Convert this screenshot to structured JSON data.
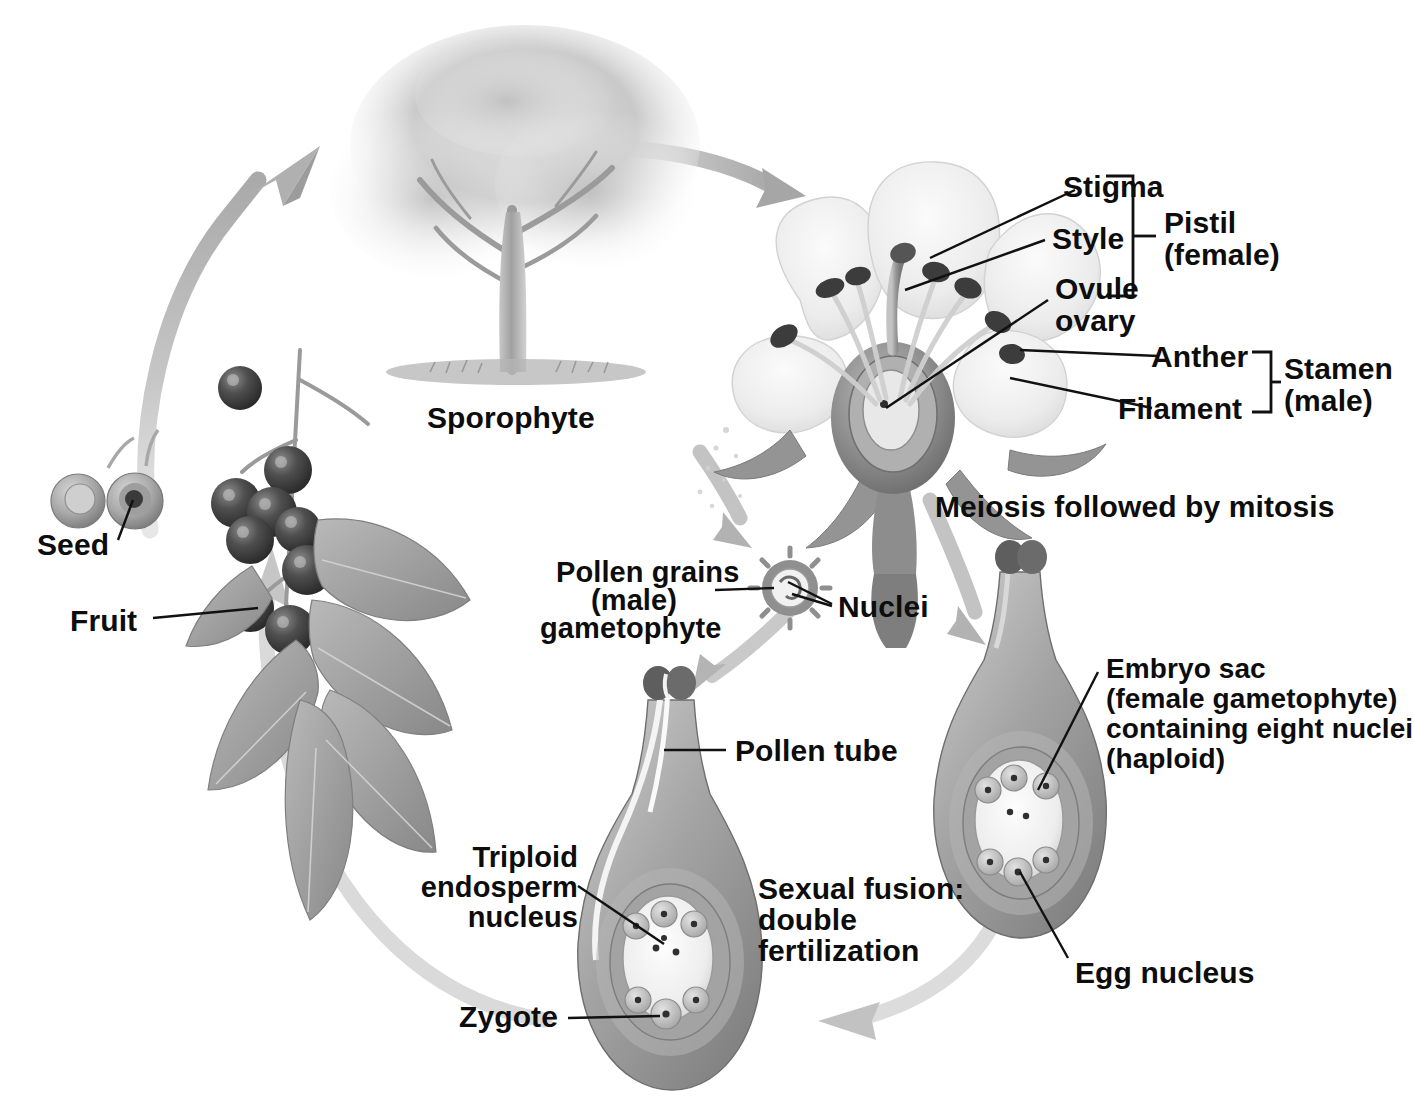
{
  "diagram": {
    "type": "biology-life-cycle-diagram",
    "palette": {
      "ink": "#0d0d0d",
      "arrow_gray": "#b6b6b6",
      "arrow_gray_dark": "#9a9a9a",
      "tissue_mid": "#9c9c9c",
      "tissue_dark": "#6f6f6f",
      "tissue_light": "#d8d8d8",
      "petal": "#ededed",
      "background": "#ffffff"
    }
  },
  "labels": {
    "sporophyte": "Sporophyte",
    "seed": "Seed",
    "fruit": "Fruit",
    "stigma": "Stigma",
    "style": "Style",
    "ovule": "Ovule",
    "ovary": "ovary",
    "pistil_line1": "Pistil",
    "pistil_line2": "(female)",
    "anther": "Anther",
    "filament": "Filament",
    "stamen_line1": "Stamen",
    "stamen_line2": "(male)",
    "meiosis": "Meiosis followed by mitosis",
    "pollen_line1": "Pollen grains",
    "pollen_line2": "(male)",
    "pollen_line3": "gametophyte",
    "nuclei": "Nuclei",
    "pollen_tube": "Pollen tube",
    "embryo_sac_line1": "Embryo sac",
    "embryo_sac_line2": "(female gametophyte)",
    "embryo_sac_line3": "containing eight nuclei",
    "embryo_sac_line4": "(haploid)",
    "egg_nucleus": "Egg nucleus",
    "triploid_line1": "Triploid",
    "triploid_line2": "endosperm",
    "triploid_line3": "nucleus",
    "zygote": "Zygote",
    "fusion_line1": "Sexual fusion:",
    "fusion_line2": "double",
    "fusion_line3": "fertilization"
  },
  "brackets": [
    {
      "name": "pistil-bracket",
      "group": "Pistil (female)",
      "members": [
        "Stigma",
        "Style",
        "Ovule ovary"
      ]
    },
    {
      "name": "stamen-bracket",
      "group": "Stamen (male)",
      "members": [
        "Anther",
        "Filament"
      ]
    }
  ],
  "stages": [
    {
      "name": "sporophyte-tree",
      "label": "Sporophyte"
    },
    {
      "name": "flower",
      "label": "Meiosis followed by mitosis"
    },
    {
      "name": "pollen-grain",
      "label": "Pollen grains (male) gametophyte"
    },
    {
      "name": "ovule-embryo-sac",
      "label": "Embryo sac (female gametophyte) containing eight nuclei (haploid)"
    },
    {
      "name": "fertilized-ovule",
      "label": "Sexual fusion: double fertilization"
    },
    {
      "name": "fruit-berries",
      "label": "Fruit"
    },
    {
      "name": "seeds",
      "label": "Seed"
    }
  ],
  "cycle_arrows": [
    {
      "name": "arrow-seed-to-tree",
      "from": "Seed",
      "to": "Sporophyte"
    },
    {
      "name": "arrow-tree-to-flower",
      "from": "Sporophyte",
      "to": "Flower"
    },
    {
      "name": "arrow-flower-to-pollen",
      "from": "Flower",
      "to": "Pollen grains"
    },
    {
      "name": "arrow-flower-to-ovule",
      "from": "Flower",
      "to": "Embryo sac"
    },
    {
      "name": "arrow-pollen-to-pollen-tube",
      "from": "Pollen grains",
      "to": "Pollen tube"
    },
    {
      "name": "arrow-ovule-to-fertilization",
      "from": "Embryo sac",
      "to": "Double fertilization"
    },
    {
      "name": "arrow-fertilization-to-fruit",
      "from": "Double fertilization",
      "to": "Fruit"
    }
  ]
}
